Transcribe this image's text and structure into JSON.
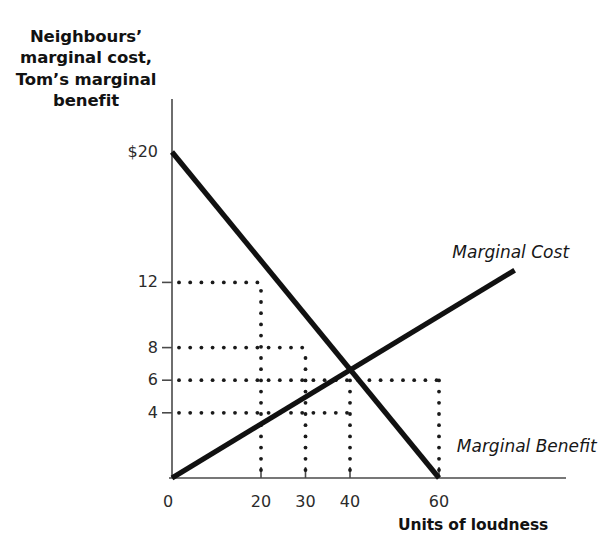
{
  "figure": {
    "background_color": "#ffffff",
    "axis_color": "#4a4a4a",
    "curve_color": "#111111",
    "dot_color": "#1a1a1a"
  },
  "axes": {
    "y_title_lines": [
      "Neighbours’",
      "marginal cost,",
      "Tom’s marginal",
      "benefit"
    ],
    "x_title": "Units of loudness",
    "origin_label": "0"
  },
  "chart_data": {
    "type": "line",
    "title": "",
    "xlabel": "Units of loudness",
    "ylabel": "Neighbours’ marginal cost, Tom’s marginal benefit",
    "xlim": [
      0,
      88
    ],
    "ylim": [
      0,
      21
    ],
    "grid": false,
    "legend": "inline-curve-labels",
    "x_ticks": [
      {
        "value": 0,
        "label": "0"
      },
      {
        "value": 20,
        "label": "20"
      },
      {
        "value": 30,
        "label": "30"
      },
      {
        "value": 40,
        "label": "40"
      },
      {
        "value": 60,
        "label": "60"
      }
    ],
    "y_ticks": [
      {
        "value": 20,
        "label": "$20"
      },
      {
        "value": 12,
        "label": "12"
      },
      {
        "value": 8,
        "label": "8"
      },
      {
        "value": 6,
        "label": "6"
      },
      {
        "value": 4,
        "label": "4"
      }
    ],
    "series": [
      {
        "name": "Marginal Cost",
        "label": "Marginal Cost",
        "style": "solid-thick",
        "points": [
          [
            0,
            0
          ],
          [
            77,
            12.75
          ]
        ]
      },
      {
        "name": "Marginal Benefit",
        "label": "Marginal Benefit",
        "style": "solid-thick",
        "points": [
          [
            0,
            20
          ],
          [
            60,
            0
          ]
        ]
      }
    ],
    "equilibrium": {
      "x": 40,
      "y": 4
    },
    "guide_lines": {
      "horizontal": [
        {
          "y": 12,
          "x_end": 20
        },
        {
          "y": 8,
          "x_end": 30
        },
        {
          "y": 6,
          "x_end": 60
        },
        {
          "y": 4,
          "x_end": 40
        }
      ],
      "vertical": [
        {
          "x": 20,
          "y_end": 12
        },
        {
          "x": 30,
          "y_end": 8
        },
        {
          "x": 40,
          "y_end": 6
        },
        {
          "x": 60,
          "y_end": 6
        }
      ]
    },
    "annotations": [
      {
        "text": "Marginal Cost",
        "x": 63,
        "y": 13.8,
        "italic": true
      },
      {
        "text": "Marginal Benefit",
        "x": 64,
        "y": 1.9,
        "italic": true
      }
    ]
  }
}
